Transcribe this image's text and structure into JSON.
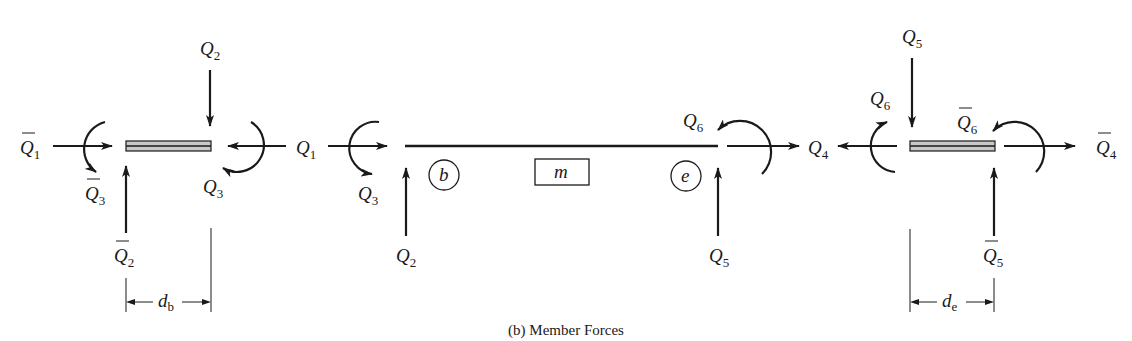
{
  "caption": "(b) Member Forces",
  "member_label": "m",
  "nodes": {
    "b": "b",
    "e": "e"
  },
  "left_joint": {
    "labels": {
      "Q1bar": {
        "base": "Q",
        "sub": "1",
        "bar": true
      },
      "Q2": {
        "base": "Q",
        "sub": "2"
      },
      "Q1": {
        "base": "Q",
        "sub": "1"
      },
      "Q3bar": {
        "base": "Q",
        "sub": "3",
        "bar": true
      },
      "Q3": {
        "base": "Q",
        "sub": "3"
      },
      "Q2bar": {
        "base": "Q",
        "sub": "2",
        "bar": true
      }
    },
    "dimension": {
      "base": "d",
      "sub": "b"
    }
  },
  "member": {
    "labels": {
      "Q1": {
        "base": "Q",
        "sub": "1"
      },
      "Q3": {
        "base": "Q",
        "sub": "3"
      },
      "Q2": {
        "base": "Q",
        "sub": "2"
      },
      "Q6": {
        "base": "Q",
        "sub": "6"
      },
      "Q5": {
        "base": "Q",
        "sub": "5"
      },
      "Q4": {
        "base": "Q",
        "sub": "4"
      }
    }
  },
  "right_joint": {
    "labels": {
      "Q5": {
        "base": "Q",
        "sub": "5"
      },
      "Q6": {
        "base": "Q",
        "sub": "6"
      },
      "Q6bar": {
        "base": "Q",
        "sub": "6",
        "bar": true
      },
      "Q4bar": {
        "base": "Q",
        "sub": "4",
        "bar": true
      },
      "Q5bar": {
        "base": "Q",
        "sub": "5",
        "bar": true
      }
    },
    "dimension": {
      "base": "d",
      "sub": "e"
    }
  }
}
